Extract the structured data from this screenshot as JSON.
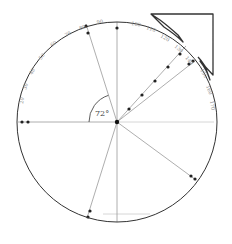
{
  "diagram": {
    "type": "protractor-circle",
    "width": 232,
    "height": 244,
    "circle": {
      "cx": 117,
      "cy": 122,
      "r": 100,
      "stroke": "#333333"
    },
    "angle_label": "72°",
    "angle_arc": {
      "r": 28,
      "from_deg": 180,
      "to_deg": 108
    },
    "colors": {
      "line": "#999999",
      "dark": "#222222",
      "arc": "#333333",
      "label": "#888888"
    },
    "radial_lines": [
      {
        "name": "left-horizontal",
        "x2": 18,
        "y2": 122,
        "dots": [
          [
            22,
            122
          ],
          [
            28,
            122
          ]
        ]
      },
      {
        "name": "up-left",
        "x2": 86,
        "y2": 24,
        "dots": [
          [
            86,
            26
          ],
          [
            88,
            33
          ]
        ]
      },
      {
        "name": "vertical",
        "x2": 117,
        "y2": 22,
        "dots": [
          [
            117,
            28
          ]
        ]
      },
      {
        "name": "diag-upper",
        "x2": 205,
        "y2": 25,
        "dots": [
          [
            129,
            109
          ],
          [
            142,
            95
          ],
          [
            155,
            81
          ],
          [
            168,
            67
          ],
          [
            180,
            54
          ],
          [
            191,
            42
          ],
          [
            205,
            28
          ]
        ]
      },
      {
        "name": "diag-lower",
        "x2": 196,
        "y2": 60,
        "dots": [
          [
            189,
            64
          ],
          [
            193,
            61
          ]
        ]
      },
      {
        "name": "lower-right",
        "x2": 196,
        "y2": 180,
        "dots": [
          [
            191,
            176
          ],
          [
            195,
            179
          ]
        ]
      },
      {
        "name": "lower-left",
        "x2": 87,
        "y2": 218,
        "dots": [
          [
            90,
            211
          ],
          [
            88,
            217
          ]
        ]
      },
      {
        "name": "down",
        "x2": 117,
        "y2": 222,
        "dots": []
      }
    ],
    "short_lines": [
      {
        "x1": 103,
        "y1": 214,
        "x2": 150,
        "y2": 214
      },
      {
        "x1": 117,
        "y1": 122,
        "x2": 170,
        "y2": 122
      },
      {
        "x1": 170,
        "y1": 122,
        "x2": 214,
        "y2": 122
      }
    ],
    "tick_labels": [
      {
        "text": "90",
        "x": 97,
        "y": 24,
        "rot": -10
      },
      {
        "text": "80",
        "x": 80,
        "y": 30,
        "rot": -20
      },
      {
        "text": "70",
        "x": 66,
        "y": 37,
        "rot": -30
      },
      {
        "text": "60",
        "x": 52,
        "y": 47,
        "rot": -40
      },
      {
        "text": "50",
        "x": 41,
        "y": 60,
        "rot": -50
      },
      {
        "text": "40",
        "x": 32,
        "y": 75,
        "rot": -60
      },
      {
        "text": "30",
        "x": 26,
        "y": 90,
        "rot": -70
      },
      {
        "text": "20",
        "x": 23,
        "y": 104,
        "rot": -80
      },
      {
        "text": "100",
        "x": 131,
        "y": 25,
        "rot": 10
      },
      {
        "text": "110",
        "x": 146,
        "y": 29,
        "rot": 20
      },
      {
        "text": "120",
        "x": 160,
        "y": 37,
        "rot": 30
      },
      {
        "text": "130",
        "x": 174,
        "y": 47,
        "rot": 40
      },
      {
        "text": "140",
        "x": 185,
        "y": 58,
        "rot": 50
      },
      {
        "text": "150",
        "x": 200,
        "y": 70,
        "rot": 60
      },
      {
        "text": "160",
        "x": 206,
        "y": 86,
        "rot": 70
      },
      {
        "text": "170",
        "x": 210,
        "y": 101,
        "rot": 80
      }
    ],
    "arrow": {
      "points": "152,14 214,14 214,76 202,64 200,59 207,73 210,81 206,66 199,56 186,42 176,34 163,26",
      "stroke": "#333333"
    }
  }
}
